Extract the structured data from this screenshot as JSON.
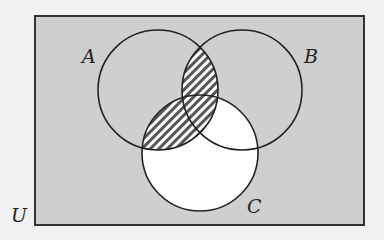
{
  "diagram": {
    "type": "venn",
    "universe_label": "U",
    "sets": [
      {
        "name": "A",
        "label": "A",
        "cx": 158,
        "cy": 90,
        "r": 60
      },
      {
        "name": "B",
        "label": "B",
        "cx": 242,
        "cy": 90,
        "r": 60
      },
      {
        "name": "C",
        "label": "C",
        "cx": 200,
        "cy": 153,
        "r": 58
      }
    ],
    "shaded_regions": {
      "hatched": [
        "A∩B",
        "A∩C"
      ],
      "white": [
        "C (excluding A)"
      ],
      "grey": [
        "U outside hatched/white regions"
      ]
    },
    "colors": {
      "page_background": "#f1f1f1",
      "universe_fill": "#cfcfcf",
      "hatch_line": "#555555",
      "outline": "#222222",
      "white_region": "#ffffff"
    }
  }
}
